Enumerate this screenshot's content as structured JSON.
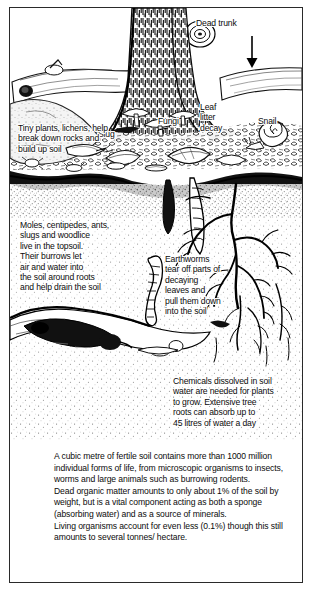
{
  "figure": {
    "border_color": "#2a2a2a",
    "background": "#ffffff",
    "ink_color": "#0b0b0b"
  },
  "labels": {
    "dead_trunk": "Dead trunk",
    "fungi": "Fungi",
    "leaf_litter_decay": "Leaf\nlitter\ndecay",
    "snail": "Snail",
    "slug": "Slug",
    "tiny_plants": "Tiny plants, lichens, help\nbreak down rocks and\nbuild up soil",
    "moles": "Moles, centipedes, ants,\nslugs and woodlice\nlive in the topsoil.\nTheir burrows let\nair and water into\nthe soil around roots\nand help drain the soil",
    "earthworms": "Earthworms\ntear off parts of\ndecaying\nleaves and\npull them down\ninto the soil",
    "chemicals": "Chemicals dissolved in soil\nwater are needed for plants\nto grow. Extensive tree\nroots can absorb up to\n45 litres of water a day"
  },
  "caption": {
    "paragraphs": [
      "A cubic metre of fertile soil contains more than 1000 million individual forms of life, from microscopic organisms to insects, worms and large animals such as burrowing rodents.",
      "Dead organic matter amounts to only about 1% of the soil by weight, but is a vital component acting as both a sponge (absorbing water) and as a source of minerals.",
      "Living organisms account for even less (0.1%) though this still amounts to several tonnes/ hectare."
    ]
  },
  "icons": {
    "arrow": "down-arrow-icon",
    "tree": "tree-trunk-icon",
    "roots": "tree-roots-icon",
    "mole": "mole-icon",
    "earthworm": "earthworm-icon",
    "snail": "snail-icon",
    "slug": "slug-icon",
    "mushroom": "mushroom-icon",
    "log": "fallen-log-icon"
  }
}
